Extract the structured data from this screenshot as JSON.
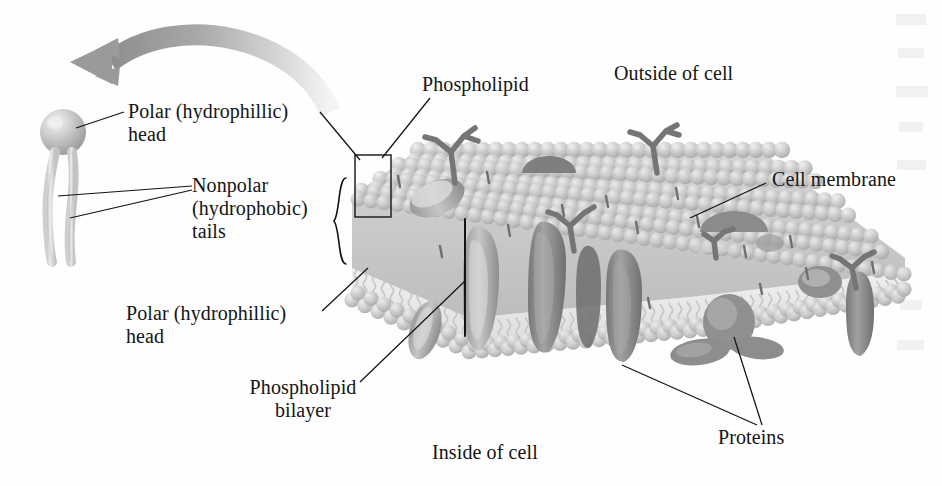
{
  "figure": {
    "background_color": "#fefefe",
    "ink_color": "#141414"
  },
  "labels": {
    "polar_head_top": "Polar (hydrophillic)\nhead",
    "nonpolar_tails": "Nonpolar\n(hydrophobic)\ntails",
    "polar_head_bottom": "Polar (hydrophillic)\nhead",
    "phospholipid": "Phospholipid",
    "phospholipid_bilayer": "Phospholipid\nbilayer",
    "outside_of_cell": "Outside of cell",
    "inside_of_cell": "Inside of cell",
    "cell_membrane": "Cell membrane",
    "proteins": "Proteins"
  },
  "icons": {
    "zoom_arrow": "curved-magnify-arrow-icon",
    "callout_box": "callout-rectangle-icon",
    "curly_brace": "curly-brace-icon",
    "bilayer_bracket": "bracket-icon",
    "phospholipid_molecule": "phospholipid-molecule-icon",
    "glycoprotein": "branched-carbohydrate-icon"
  },
  "colors": {
    "head_sphere": "#b9b9b9",
    "head_sphere_light": "#e8e8e8",
    "tail": "#d6d6d6",
    "membrane_top": "#c8c8c8",
    "membrane_core": "#ececec",
    "protein_dark": "#8a8a8a",
    "protein_mid": "#a5a5a5",
    "arrow_gray": "#9a9a9a",
    "leader_line": "#141414"
  },
  "structures": {
    "membrane_orientation": "3D slab tapering to a point at right",
    "top_layer": "phosphate head spheres facing outside of cell",
    "core_layer": "wavy hydrophobic fatty-acid tails",
    "bottom_layer": "phosphate head spheres facing inside of cell",
    "embedded_protein_count": 9,
    "glycoprotein_count": 5
  }
}
